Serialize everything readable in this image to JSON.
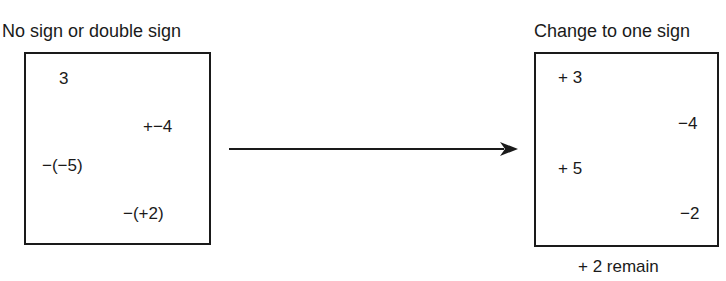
{
  "left": {
    "title": "No sign or double sign",
    "items": [
      "3",
      "+−4",
      "−(−5)",
      "−(+2)"
    ]
  },
  "right": {
    "title": "Change to one sign",
    "items": [
      "+ 3",
      "−4",
      "+ 5",
      "−2"
    ],
    "caption": "+ 2 remain"
  },
  "arrow": {
    "direction": "right",
    "color": "#1a1a1a"
  }
}
